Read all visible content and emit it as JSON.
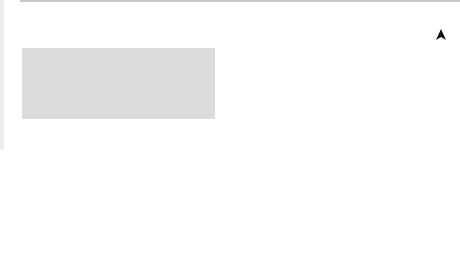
{
  "diagram": {
    "colors": {
      "courtyard_fill": "#dcdcdc",
      "fence_post": "#8a8a8a",
      "fence_line": "#7a7a7a",
      "tabernacle_outer": "#8c8c8c",
      "tabernacle_inner": "#c4c4c4",
      "furniture": "#8a8a8a",
      "ink": "#111111"
    },
    "headings": {
      "holy_of_holies": [
        "Holy of",
        "Holies"
      ],
      "holy_place": [
        "Holy",
        "place"
      ],
      "courtyard": "Courtyard"
    },
    "compass": {
      "letter": "N"
    },
    "labels": {
      "altar_of_incense": [
        "Altar of",
        "incense"
      ],
      "table_of_showbread": [
        "Table of",
        "showbread"
      ],
      "laver": "Laver",
      "entrance_gate": [
        "Entrance",
        "gate"
      ],
      "tabernacle": "Tabernacle",
      "veil": "Veil",
      "door": "Door",
      "ark_of_the_covenant": "Ark of the Covenant",
      "menorah": "Menorah",
      "altar_of_sacrifice": [
        "Altar of",
        "sacrifice"
      ]
    }
  }
}
